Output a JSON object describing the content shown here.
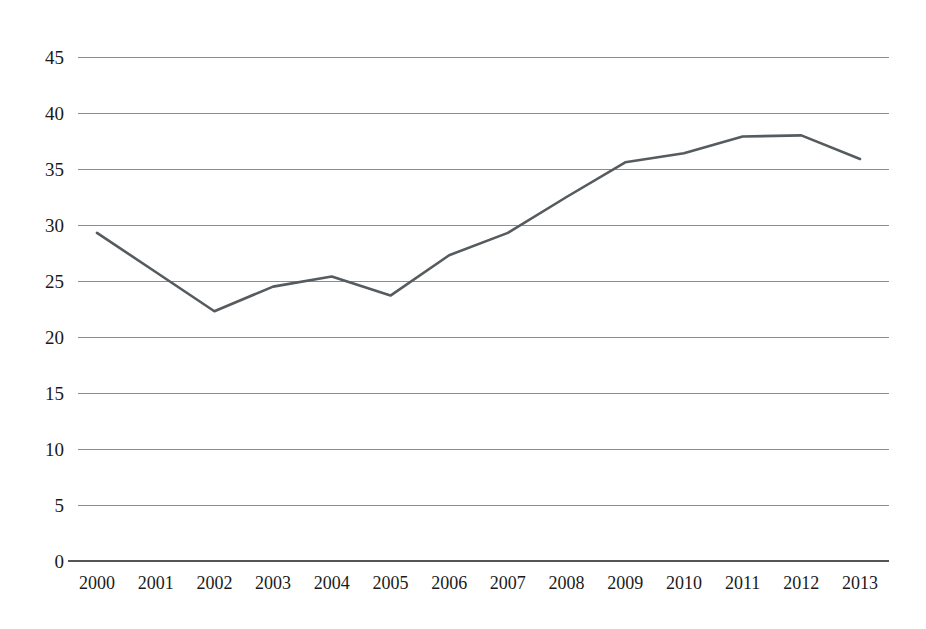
{
  "chart_data": {
    "type": "line",
    "title": "",
    "subtitle": "",
    "xlabel": "",
    "ylabel": "",
    "categories": [
      "2000",
      "2001",
      "2002",
      "2003",
      "2004",
      "2005",
      "2006",
      "2007",
      "2008",
      "2009",
      "2010",
      "2011",
      "2012",
      "2013"
    ],
    "x": [
      2000,
      2001,
      2002,
      2003,
      2004,
      2005,
      2006,
      2007,
      2008,
      2009,
      2010,
      2011,
      2012,
      2013
    ],
    "values": [
      29.3,
      25.8,
      22.3,
      24.5,
      25.4,
      23.7,
      27.3,
      29.3,
      32.5,
      35.6,
      36.4,
      37.9,
      38.0,
      35.9
    ],
    "series": [
      {
        "name": "series-1",
        "color": "#555b5e",
        "values": [
          29.3,
          25.8,
          22.3,
          24.5,
          25.4,
          23.7,
          27.3,
          29.3,
          32.5,
          35.6,
          36.4,
          37.9,
          38.0,
          35.9
        ]
      }
    ],
    "ylim": [
      0,
      45
    ],
    "xlim": [
      2000,
      2013
    ],
    "yticks": [
      0,
      5,
      10,
      15,
      20,
      25,
      30,
      35,
      40,
      45
    ],
    "ytick_labels": [
      "0",
      "5",
      "10",
      "15",
      "20",
      "25",
      "30",
      "35",
      "40",
      "45"
    ],
    "xtick_labels": [
      "2000",
      "2001",
      "2002",
      "2003",
      "2004",
      "2005",
      "2006",
      "2007",
      "2008",
      "2009",
      "2010",
      "2011",
      "2012",
      "2013"
    ],
    "grid": true,
    "grid_axis": "y",
    "legend": false,
    "legend_position": "none",
    "annotations": [],
    "line_color": "#555b5e",
    "grid_color": "#8c8c8c",
    "background_color": "#ffffff",
    "markers": false
  },
  "layout": {
    "plot_left": 78,
    "plot_right": 889,
    "plot_top": 57,
    "plot_bottom": 561,
    "first_point_x": 97,
    "last_point_x": 860
  }
}
